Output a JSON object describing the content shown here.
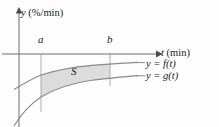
{
  "figure": {
    "background_color": "#fdfdfd",
    "axes": {
      "y_axis_label": "y (%/min)",
      "t_axis_label": "t (min)",
      "y_axis_variable": "y",
      "y_axis_units": "(%/min)",
      "t_axis_variable": "t",
      "t_axis_units": "(min)",
      "axis_color": "#6f6f6f"
    },
    "bounds": {
      "lower_limit_label": "a",
      "upper_limit_label": "b"
    },
    "region": {
      "label": "S",
      "fill_color": "#dcdcdc",
      "stroke_color": "#8a8a8a"
    },
    "curves": [
      {
        "name": "upper-curve",
        "label": "y = f(t)",
        "label_lhs": "y",
        "label_eq": "=",
        "label_rhs": "f(t)",
        "stroke_color": "#8a8a8a"
      },
      {
        "name": "lower-curve",
        "label": "y = g(t)",
        "label_lhs": "y",
        "label_eq": "=",
        "label_rhs": "g(t)",
        "stroke_color": "#8a8a8a"
      }
    ]
  },
  "chart_data": {
    "type": "area",
    "title": "",
    "xlabel": "t (min)",
    "ylabel": "y (%/min)",
    "grid": false,
    "legend_position": "right-inline",
    "annotations": [
      "a",
      "b",
      "S"
    ],
    "series": [
      {
        "name": "y = f(t)",
        "points": [
          [
            18,
            88
          ],
          [
            41,
            75
          ],
          [
            70,
            68
          ],
          [
            110,
            64
          ],
          [
            138,
            62
          ]
        ]
      },
      {
        "name": "y = g(t)",
        "points": [
          [
            18,
            122
          ],
          [
            41,
            97
          ],
          [
            70,
            85
          ],
          [
            110,
            78
          ],
          [
            138,
            75
          ]
        ]
      }
    ],
    "shaded_between": {
      "from": "a",
      "to": "b",
      "upper": "y = f(t)",
      "lower": "y = g(t)",
      "label": "S"
    }
  }
}
